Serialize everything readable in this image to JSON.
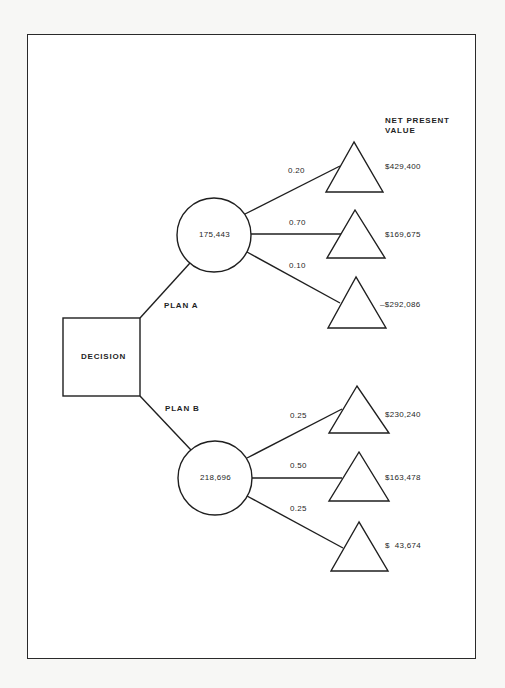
{
  "header": {
    "line1": "NET PRESENT",
    "line2": "VALUE"
  },
  "decision": {
    "label": "DECISION"
  },
  "plans": [
    {
      "label": "PLAN A",
      "expected_value": "175,443",
      "outcomes": [
        {
          "probability": "0.20",
          "npv": "$429,400"
        },
        {
          "probability": "0.70",
          "npv": "$169,675"
        },
        {
          "probability": "0.10",
          "npv": "–$292,086"
        }
      ]
    },
    {
      "label": "PLAN B",
      "expected_value": "218,696",
      "outcomes": [
        {
          "probability": "0.25",
          "npv": "$230,240"
        },
        {
          "probability": "0.50",
          "npv": "$163,478"
        },
        {
          "probability": "0.25",
          "npv": "$  43,674"
        }
      ]
    }
  ],
  "colors": {
    "stroke": "#1f1f1f",
    "paper": "#ffffff",
    "background": "#f7f7f5"
  }
}
